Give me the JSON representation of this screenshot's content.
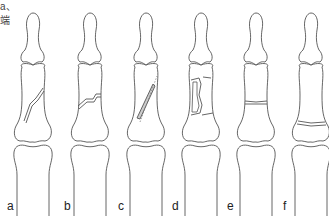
{
  "corner_text": [
    "a、",
    "端"
  ],
  "panels": [
    {
      "label": "a",
      "x": 33,
      "fracture": "oblique-long"
    },
    {
      "label": "b",
      "x": 90,
      "fracture": "oblique-short"
    },
    {
      "label": "c",
      "x": 146,
      "fracture": "spiral"
    },
    {
      "label": "d",
      "x": 201,
      "fracture": "comminuted"
    },
    {
      "label": "e",
      "x": 256,
      "fracture": "transverse-mid"
    },
    {
      "label": "f",
      "x": 311,
      "fracture": "transverse-base"
    }
  ],
  "colors": {
    "line": "#555555",
    "fill": "#ffffff",
    "dash": "#777777"
  }
}
